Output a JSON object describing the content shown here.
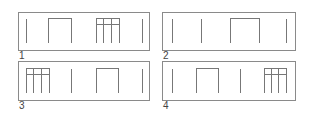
{
  "panels": [
    {
      "label": "1",
      "sequence": [
        "bar",
        "arch",
        "grid",
        "bar"
      ]
    },
    {
      "label": "2",
      "sequence": [
        "bar",
        "bar",
        "arch",
        "bar"
      ]
    },
    {
      "label": "3",
      "sequence": [
        "grid",
        "bar",
        "arch",
        "bar"
      ]
    },
    {
      "label": "4",
      "sequence": [
        "bar",
        "arch",
        "bar",
        "grid"
      ]
    }
  ],
  "colors": {
    "stroke": "#777777",
    "border": "#8a8a8a",
    "label": "#444444"
  }
}
